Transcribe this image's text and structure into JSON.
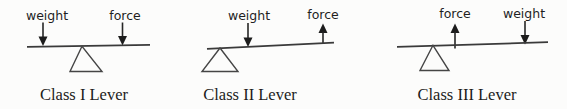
{
  "page": {
    "background": "#fcfcfb",
    "ink": "#1f1f1f",
    "line_color": "#3a3a3a"
  },
  "diagrams": [
    {
      "caption": "Class I Lever",
      "labels": {
        "left": "weight",
        "right": "force"
      },
      "arrows": {
        "left": "down",
        "right": "down"
      },
      "fulcrum_position": "center"
    },
    {
      "caption": "Class II Lever",
      "labels": {
        "left": "weight",
        "right": "force"
      },
      "arrows": {
        "left": "down",
        "right": "up"
      },
      "fulcrum_position": "left-end"
    },
    {
      "caption": "Class III Lever",
      "labels": {
        "left": "force",
        "right": "weight"
      },
      "arrows": {
        "left": "up",
        "right": "down"
      },
      "fulcrum_position": "left-end"
    }
  ]
}
